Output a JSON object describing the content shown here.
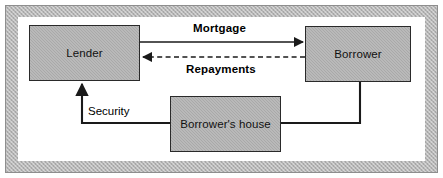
{
  "figure": {
    "background_color": "#ffffff",
    "frame_color": "#b5b5b5",
    "node_fill_color": "#a9a9a9",
    "node_border_color": "#2a2a2a",
    "line_color": "#1a1a1a"
  },
  "nodes": [
    {
      "id": "lender",
      "label": "Lender"
    },
    {
      "id": "borrower",
      "label": "Borrower"
    },
    {
      "id": "house",
      "label": "Borrower's house"
    }
  ],
  "edges": [
    {
      "id": "mortgage",
      "label": "Mortgage",
      "from": "lender",
      "to": "borrower",
      "style": "solid",
      "arrow": "end",
      "bold_label": true
    },
    {
      "id": "repayments",
      "label": "Repayments",
      "from": "borrower",
      "to": "lender",
      "style": "dashed",
      "arrow": "end",
      "bold_label": true
    },
    {
      "id": "security",
      "label": "Security",
      "from": "house",
      "to": "lender",
      "style": "solid",
      "arrow": "end",
      "bold_label": false
    }
  ]
}
